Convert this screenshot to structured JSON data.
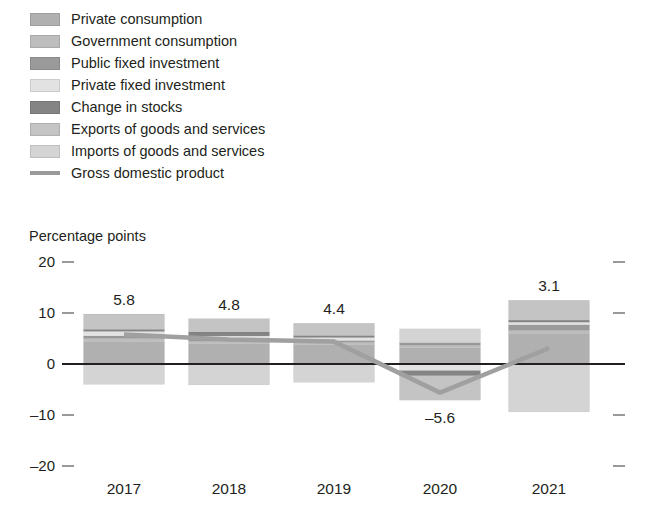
{
  "legend": {
    "items": [
      {
        "label": "Private consumption",
        "color": "#b0b0b0",
        "marker": "swatch",
        "key": "private_consumption"
      },
      {
        "label": "Government consumption",
        "color": "#bdbdbd",
        "marker": "swatch",
        "key": "government_consumption"
      },
      {
        "label": "Public fixed investment",
        "color": "#9a9a9a",
        "marker": "swatch",
        "key": "public_fixed_investment"
      },
      {
        "label": "Private fixed investment",
        "color": "#e2e2e2",
        "marker": "swatch",
        "key": "private_fixed_investment"
      },
      {
        "label": "Change in stocks",
        "color": "#848484",
        "marker": "swatch",
        "key": "change_in_stocks"
      },
      {
        "label": "Exports of goods and services",
        "color": "#c4c4c4",
        "marker": "swatch",
        "key": "exports"
      },
      {
        "label": "Imports of goods and services",
        "color": "#d4d4d4",
        "marker": "swatch",
        "key": "imports"
      },
      {
        "label": "Gross domestic product",
        "color": "#9a9a9a",
        "marker": "line",
        "key": "gdp"
      }
    ]
  },
  "axis_title": "Percentage points",
  "chart_data": {
    "type": "bar",
    "title": "",
    "subtitle": "",
    "xlabel": "",
    "ylabel": "Percentage points",
    "ylim": [
      -20,
      20
    ],
    "yticks": [
      20,
      10,
      0,
      -10,
      -20
    ],
    "ytick_labels": [
      "20",
      "10",
      "0",
      "–10",
      "–20"
    ],
    "grid": false,
    "legend_position": "top-left",
    "stacked": true,
    "categories": [
      "2017",
      "2018",
      "2019",
      "2020",
      "2021"
    ],
    "series": [
      {
        "name": "Private consumption",
        "color": "#b0b0b0",
        "values": [
          4.4,
          4.0,
          3.8,
          3.2,
          6.0
        ]
      },
      {
        "name": "Government consumption",
        "color": "#bdbdbd",
        "values": [
          0.6,
          0.5,
          0.5,
          0.5,
          0.6
        ]
      },
      {
        "name": "Public fixed investment",
        "color": "#9a9a9a",
        "values": [
          0.5,
          0.4,
          0.3,
          0.5,
          1.1
        ]
      },
      {
        "name": "Private fixed investment",
        "color": "#e2e2e2",
        "values": [
          0.9,
          0.6,
          0.6,
          -1.3,
          0.5
        ]
      },
      {
        "name": "Change in stocks",
        "color": "#848484",
        "values": [
          0.4,
          0.8,
          0.4,
          -1.0,
          0.4
        ]
      },
      {
        "name": "Exports of goods and services",
        "color": "#c4c4c4",
        "values": [
          3.0,
          2.6,
          2.4,
          -4.8,
          3.9
        ]
      },
      {
        "name": "Imports of goods and services",
        "color": "#d4d4d4",
        "values": [
          -4.0,
          -4.1,
          -3.6,
          2.7,
          -9.4
        ]
      }
    ],
    "line_series": {
      "name": "Gross domestic product",
      "color": "#a0a0a0",
      "values": [
        5.8,
        4.8,
        4.4,
        -5.6,
        3.1
      ]
    },
    "data_labels": [
      "5.8",
      "4.8",
      "4.4",
      "–5.6",
      "3.1"
    ]
  }
}
